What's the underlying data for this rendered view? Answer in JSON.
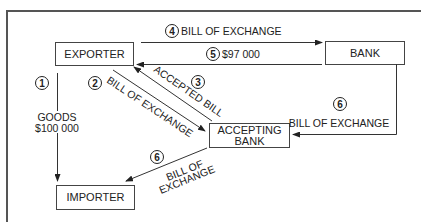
{
  "diagram": {
    "nodes": {
      "exporter": "EXPORTER",
      "bank": "BANK",
      "accepting_bank_line1": "ACCEPTING",
      "accepting_bank_line2": "BANK",
      "importer": "IMPORTER"
    },
    "steps": {
      "s1": {
        "num": "1",
        "line1": "GOODS",
        "line2": "$100 000"
      },
      "s2": {
        "num": "2",
        "label": "BILL OF EXCHANGE"
      },
      "s3": {
        "num": "3",
        "label": "ACCEPTED BILL"
      },
      "s4": {
        "num": "4",
        "label": "BILL OF EXCHANGE"
      },
      "s5": {
        "num": "5",
        "label": "$97 000"
      },
      "s6a": {
        "num": "6",
        "label": "BILL OF EXCHANGE"
      },
      "s6b": {
        "num": "6",
        "line1": "BILL OF",
        "line2": "EXCHANGE"
      }
    },
    "colors": {
      "line": "#333333",
      "frame": "#555555",
      "background": "#ffffff"
    }
  }
}
